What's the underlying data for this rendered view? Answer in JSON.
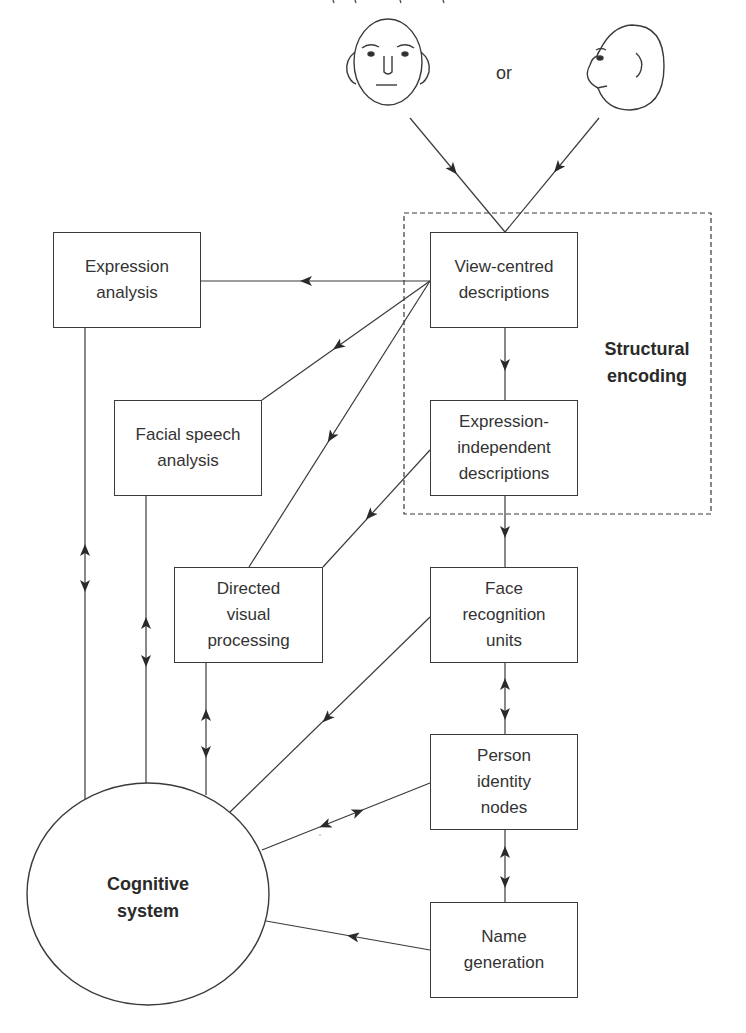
{
  "diagram": {
    "title_clipped": "",
    "stimuli": {
      "front_face": {
        "icon": "front-face-icon"
      },
      "or_label": "or",
      "profile_face": {
        "icon": "profile-face-icon"
      }
    },
    "group": {
      "label": "Structural\nencoding",
      "style": "dashed"
    },
    "nodes": {
      "view_centred": "View-centred\ndescriptions",
      "expression_independent": "Expression-\nindependent\ndescriptions",
      "expression_analysis": "Expression\nanalysis",
      "facial_speech": "Facial speech\nanalysis",
      "directed_visual": "Directed\nvisual\nprocessing",
      "face_recognition": "Face\nrecognition\nunits",
      "person_identity": "Person\nidentity\nnodes",
      "name_generation": "Name\ngeneration",
      "cognitive_system": "Cognitive\nsystem"
    },
    "edges": [
      {
        "from": "front_face",
        "to": "view_centred",
        "type": "arrow"
      },
      {
        "from": "profile_face",
        "to": "view_centred",
        "type": "arrow"
      },
      {
        "from": "view_centred",
        "to": "expression_analysis",
        "type": "arrow"
      },
      {
        "from": "view_centred",
        "to": "facial_speech",
        "type": "arrow"
      },
      {
        "from": "view_centred",
        "to": "directed_visual",
        "type": "arrow"
      },
      {
        "from": "view_centred",
        "to": "expression_independent",
        "type": "arrow"
      },
      {
        "from": "expression_independent",
        "to": "directed_visual",
        "type": "arrow"
      },
      {
        "from": "expression_independent",
        "to": "face_recognition",
        "type": "arrow"
      },
      {
        "from": "face_recognition",
        "to": "person_identity",
        "type": "bidirectional"
      },
      {
        "from": "person_identity",
        "to": "name_generation",
        "type": "bidirectional"
      },
      {
        "from": "face_recognition",
        "to": "cognitive_system",
        "type": "arrow"
      },
      {
        "from": "person_identity",
        "to": "cognitive_system",
        "type": "bidirectional"
      },
      {
        "from": "name_generation",
        "to": "cognitive_system",
        "type": "arrow"
      },
      {
        "from": "expression_analysis",
        "to": "cognitive_system",
        "type": "bidirectional"
      },
      {
        "from": "facial_speech",
        "to": "cognitive_system",
        "type": "bidirectional"
      },
      {
        "from": "directed_visual",
        "to": "cognitive_system",
        "type": "bidirectional"
      }
    ],
    "colors": {
      "stroke": "#3a3a3a",
      "text": "#2a2a2a",
      "background": "#ffffff"
    }
  }
}
